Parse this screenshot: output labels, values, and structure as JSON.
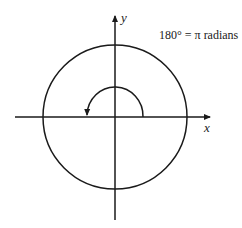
{
  "diagram": {
    "caption": "180° = π radians",
    "x_axis_label": "x",
    "y_axis_label": "y",
    "elements": [
      {
        "type": "x-axis",
        "arrow": "right"
      },
      {
        "type": "y-axis",
        "arrow": "up"
      },
      {
        "type": "circle",
        "center": "origin"
      },
      {
        "type": "arc",
        "description": "half-turn counterclockwise arrow from positive x-axis to negative x-axis",
        "angle_degrees": 180
      }
    ],
    "stroke_color": "#1a1a1a"
  }
}
